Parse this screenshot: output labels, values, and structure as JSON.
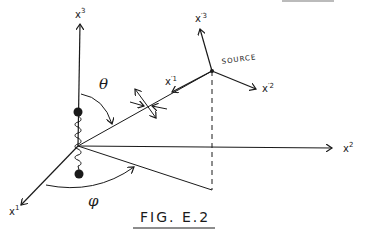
{
  "figure": {
    "caption": "FIG. E.2",
    "axes": {
      "x1": {
        "base": "x",
        "sup": "1"
      },
      "x2": {
        "base": "x",
        "sup": "2"
      },
      "x3": {
        "base": "x",
        "sup": "3"
      }
    },
    "source_axes": {
      "x1p": {
        "base": "x",
        "sup": "′1"
      },
      "x2p": {
        "base": "x",
        "sup": "′2"
      },
      "x3p": {
        "base": "x",
        "sup": "′3"
      }
    },
    "source_label": "SOURCE",
    "angles": {
      "theta": "θ",
      "phi": "φ"
    },
    "colors": {
      "ink": "#1a1a1a",
      "background": "#ffffff"
    }
  }
}
